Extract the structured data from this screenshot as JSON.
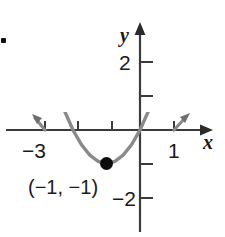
{
  "figure": {
    "bullet": "·",
    "axis_labels": {
      "x": "x",
      "y": "y"
    },
    "tick_labels": {
      "y_positive": "2",
      "y_negative": "−2",
      "x_left": "−3",
      "x_right": "1"
    },
    "annotations": [
      {
        "name": "vertex-label",
        "text": "(−1, −1)"
      }
    ],
    "colors": {
      "axis": "#3b3b3b",
      "curve": "#8a8a8a",
      "point": "#0d0d0d",
      "text": "#1a1a1a",
      "background": "#ffffff"
    }
  },
  "chart_data": {
    "type": "line",
    "title": "",
    "xlabel": "x",
    "ylabel": "y",
    "grid": false,
    "legend": null,
    "xlim": [
      -3.6,
      1.6
    ],
    "ylim": [
      -2.4,
      2.4
    ],
    "xticks": [
      -3,
      -2,
      -1,
      1
    ],
    "xtick_labels": [
      "−3",
      "",
      "",
      "1"
    ],
    "yticks": [
      2,
      1,
      -1,
      -2
    ],
    "ytick_labels": [
      "2",
      "",
      "",
      "−2"
    ],
    "series": [
      {
        "name": "parabola",
        "equation": "y = (x + 1)^2 - 1",
        "color": "#8a8a8a",
        "arrows": "both",
        "x": [
          -3.45,
          -3.2,
          -3.0,
          -2.75,
          -2.5,
          -2.25,
          -2.0,
          -1.75,
          -1.5,
          -1.25,
          -1.0,
          -0.75,
          -0.5,
          -0.25,
          0.0,
          0.25,
          0.5,
          0.75,
          1.0,
          1.2,
          1.45
        ],
        "y": [
          5.0,
          3.84,
          3.0,
          2.0625,
          1.25,
          0.5625,
          0.0,
          -0.4375,
          -0.75,
          -0.9375,
          -1.0,
          -0.9375,
          -0.75,
          -0.4375,
          0.0,
          0.5625,
          1.25,
          2.0625,
          3.0,
          3.84,
          5.0
        ]
      }
    ],
    "points": [
      {
        "name": "vertex",
        "x": -1,
        "y": -1,
        "label": "(−1, −1)",
        "marker": "filled-circle"
      }
    ],
    "xintercepts": [
      -3,
      1
    ]
  }
}
